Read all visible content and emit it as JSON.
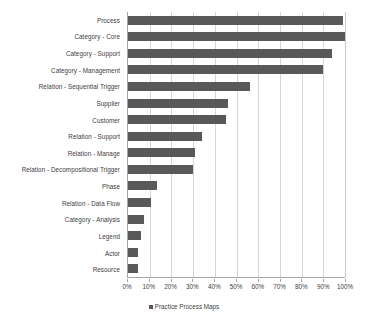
{
  "chart_data": {
    "type": "bar",
    "orientation": "horizontal",
    "title": "",
    "xlabel": "",
    "ylabel": "",
    "xlim": [
      0,
      100
    ],
    "grid": true,
    "legend_position": "bottom",
    "bar_color": "#595959",
    "gridline_color": "#d6d6d6",
    "axis_color": "#a6a6a6",
    "xticks": [
      "0%",
      "10%",
      "20%",
      "30%",
      "40%",
      "50%",
      "60%",
      "70%",
      "80%",
      "90%",
      "100%"
    ],
    "xtick_values": [
      0,
      10,
      20,
      30,
      40,
      50,
      60,
      70,
      80,
      90,
      100
    ],
    "categories": [
      "Process",
      "Category - Core",
      "Category - Support",
      "Category - Management",
      "Relation - Sequential Trigger",
      "Supplier",
      "Customer",
      "Relation - Support",
      "Relation - Manage",
      "Relation - Decompositional Trigger",
      "Phase",
      "Relation - Data Flow",
      "Category - Analysis",
      "Legend",
      "Actor",
      "Resource"
    ],
    "series": [
      {
        "name": "Practice Process Maps",
        "values": [
          99,
          100,
          94,
          90,
          56,
          46,
          45,
          34,
          31,
          30,
          13.5,
          10.5,
          7.5,
          6,
          4.5,
          4.5
        ]
      }
    ],
    "legend": [
      "Practice Process Maps"
    ]
  }
}
